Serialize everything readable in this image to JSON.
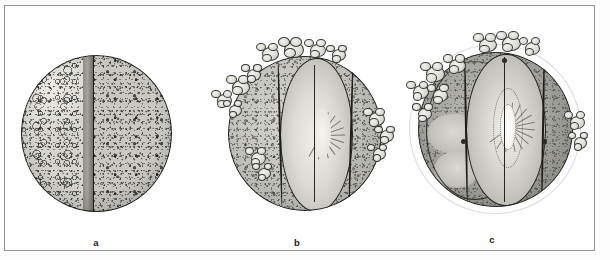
{
  "figure": {
    "kind": "scientific-illustration",
    "medium": "grayscale-scanned-line-drawing",
    "panel_count": 3,
    "border_color": "#9a9a9c",
    "background_color": "#fdfdfd",
    "ink_color": "#20201f"
  },
  "panels": [
    {
      "id": "a",
      "caption": "a",
      "title": "Stage a",
      "sphere": {
        "fill": "#c9c8c3",
        "left_half_fill": "#d5d4cf",
        "right_half_fill": "#c9c8c3",
        "septum_fill": "#8e8d88",
        "features": [
          "vertical midline septum left of centre",
          "left hemisphere pale with numerous rounded vesicles",
          "right hemisphere uniform fine stipple",
          "unbroken outer contour"
        ]
      }
    },
    {
      "id": "b",
      "caption": "b",
      "title": "Stage b",
      "sphere": {
        "fill": "#c2c1bc",
        "lens_fill": "#dcdbd6",
        "features": [
          "central lens-shaped chamber bounded by two arched ribs",
          "radial striations inside lens",
          "cauliflower-like blob clusters on upper-left and right margin",
          "pale core at lens centre"
        ]
      },
      "blobs": [
        {
          "x": 28,
          "y": 4,
          "w": 15,
          "h": 12
        },
        {
          "x": 40,
          "y": 1,
          "w": 18,
          "h": 14
        },
        {
          "x": 54,
          "y": 2,
          "w": 14,
          "h": 11
        },
        {
          "x": 66,
          "y": 5,
          "w": 12,
          "h": 10
        },
        {
          "x": 12,
          "y": 22,
          "w": 16,
          "h": 13
        },
        {
          "x": 4,
          "y": 30,
          "w": 13,
          "h": 11
        },
        {
          "x": 20,
          "y": 16,
          "w": 12,
          "h": 10
        },
        {
          "x": 10,
          "y": 36,
          "w": 11,
          "h": 9
        },
        {
          "x": 86,
          "y": 40,
          "w": 14,
          "h": 12
        },
        {
          "x": 92,
          "y": 50,
          "w": 12,
          "h": 10
        },
        {
          "x": 88,
          "y": 60,
          "w": 11,
          "h": 10
        },
        {
          "x": 22,
          "y": 62,
          "w": 13,
          "h": 11
        },
        {
          "x": 26,
          "y": 71,
          "w": 11,
          "h": 9
        }
      ],
      "radials": [
        -72,
        -54,
        -36,
        -18,
        0,
        18,
        36,
        54,
        72,
        96,
        120
      ]
    },
    {
      "id": "c",
      "caption": "c",
      "title": "Stage c",
      "sphere": {
        "fill": "#a3a29d",
        "halo_fill": "#efeeea",
        "lens_fill": "#dedcd7",
        "core_fill": "#ffffff",
        "features": [
          "pale translucent halo surrounding the whole sphere",
          "darker body tone than earlier stages",
          "large central lens with concentric dotted rings",
          "bright white core at lens centre",
          "dense radial striation fan",
          "blob clusters along upper-left rim and crown"
        ]
      },
      "blobs": [
        {
          "x": 40,
          "y": 1,
          "w": 16,
          "h": 12
        },
        {
          "x": 52,
          "y": 0,
          "w": 17,
          "h": 13
        },
        {
          "x": 64,
          "y": 3,
          "w": 13,
          "h": 11
        },
        {
          "x": 12,
          "y": 16,
          "w": 17,
          "h": 14
        },
        {
          "x": 24,
          "y": 12,
          "w": 15,
          "h": 12
        },
        {
          "x": 5,
          "y": 26,
          "w": 14,
          "h": 12
        },
        {
          "x": 16,
          "y": 28,
          "w": 13,
          "h": 11
        },
        {
          "x": 8,
          "y": 38,
          "w": 12,
          "h": 10
        },
        {
          "x": 88,
          "y": 42,
          "w": 13,
          "h": 11
        },
        {
          "x": 90,
          "y": 53,
          "w": 11,
          "h": 10
        }
      ],
      "radials": [
        -84,
        -66,
        -48,
        -30,
        -12,
        6,
        24,
        42,
        60,
        78,
        100,
        122,
        144
      ]
    }
  ],
  "captions": {
    "a": "a",
    "b": "b",
    "c": "c"
  }
}
